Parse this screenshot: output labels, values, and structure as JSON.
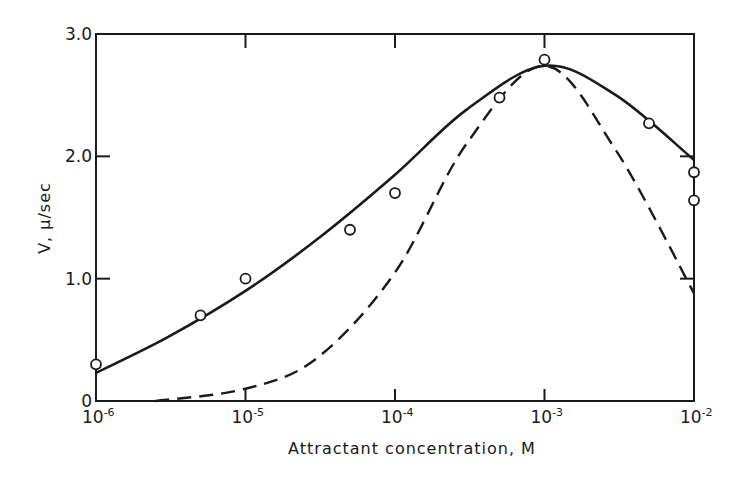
{
  "chart_data": {
    "type": "line",
    "title": "",
    "xlabel": "Attractant concentration, M",
    "ylabel": "V, μ/sec",
    "x_scale": "log",
    "xlim": [
      1e-06,
      0.01
    ],
    "ylim": [
      0,
      3.0
    ],
    "grid": false,
    "legend": null,
    "x_ticks": [
      {
        "value": 1e-06,
        "base": "10",
        "exp": "-6"
      },
      {
        "value": 1e-05,
        "base": "10",
        "exp": "-5"
      },
      {
        "value": 0.0001,
        "base": "10",
        "exp": "-4"
      },
      {
        "value": 0.001,
        "base": "10",
        "exp": "-3"
      },
      {
        "value": 0.01,
        "base": "10",
        "exp": "-2"
      }
    ],
    "y_ticks": [
      {
        "value": 0,
        "label": "0"
      },
      {
        "value": 1.0,
        "label": "1.0"
      },
      {
        "value": 2.0,
        "label": "2.0"
      },
      {
        "value": 3.0,
        "label": "3.0"
      }
    ],
    "series": [
      {
        "name": "measured",
        "style": "open-circle markers",
        "points": [
          {
            "x": 1e-06,
            "y": 0.3
          },
          {
            "x": 5e-06,
            "y": 0.7
          },
          {
            "x": 1e-05,
            "y": 1.0
          },
          {
            "x": 5e-05,
            "y": 1.4
          },
          {
            "x": 0.0001,
            "y": 1.7
          },
          {
            "x": 0.0005,
            "y": 2.48
          },
          {
            "x": 0.001,
            "y": 2.79
          },
          {
            "x": 0.005,
            "y": 2.27
          },
          {
            "x": 0.01,
            "y": 1.87
          },
          {
            "x": 0.01,
            "y": 1.64
          }
        ]
      },
      {
        "name": "theoretical curve (solid)",
        "style": "solid line",
        "points": [
          {
            "x": 1e-06,
            "y": 0.23
          },
          {
            "x": 3e-06,
            "y": 0.52
          },
          {
            "x": 1e-05,
            "y": 0.9
          },
          {
            "x": 3e-05,
            "y": 1.32
          },
          {
            "x": 0.0001,
            "y": 1.85
          },
          {
            "x": 0.0003,
            "y": 2.38
          },
          {
            "x": 0.001,
            "y": 2.74
          },
          {
            "x": 0.003,
            "y": 2.5
          },
          {
            "x": 0.01,
            "y": 1.97
          }
        ]
      },
      {
        "name": "theoretical curve (dashed)",
        "style": "dashed line",
        "points": [
          {
            "x": 2.5e-06,
            "y": 0.0
          },
          {
            "x": 1e-05,
            "y": 0.1
          },
          {
            "x": 3e-05,
            "y": 0.35
          },
          {
            "x": 0.0001,
            "y": 1.05
          },
          {
            "x": 0.0003,
            "y": 2.1
          },
          {
            "x": 0.001,
            "y": 2.74
          },
          {
            "x": 0.003,
            "y": 2.05
          },
          {
            "x": 0.01,
            "y": 0.88
          }
        ]
      }
    ]
  },
  "axes": {
    "xlabel": "Attractant concentration, M",
    "ylabel": "V, μ/sec"
  }
}
